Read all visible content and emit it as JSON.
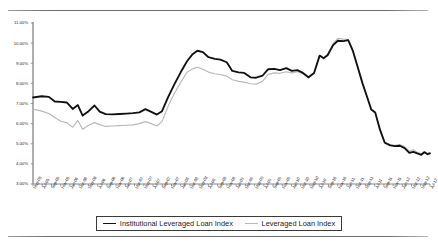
{
  "chart_data": {
    "type": "line",
    "title": "",
    "xlabel": "",
    "ylabel": "",
    "ylim": [
      3.0,
      11.0
    ],
    "ytick_values": [
      11.0,
      10.0,
      9.0,
      8.0,
      7.0,
      6.0,
      5.0,
      4.0,
      3.0
    ],
    "ytick_labels": [
      "11.00%",
      "10.00%",
      "9.00%",
      "8.00%",
      "7.00%",
      "6.00%",
      "5.00%",
      "4.00%",
      "3.00%"
    ],
    "grid": false,
    "legend_position": "bottom",
    "categories": [
      "May-05",
      "Jul-05",
      "Sep-05",
      "Nov-05",
      "Jan-06",
      "Mar-06",
      "May-06",
      "Jul-06",
      "Sep-06",
      "Nov-06",
      "Jan-07",
      "Mar-07",
      "May-07",
      "Jul-07",
      "Sep-07",
      "Nov-07",
      "Jan-08",
      "Mar-08",
      "May-08",
      "Jul-08",
      "Sep-08",
      "Nov-08",
      "Jan-09",
      "Mar-09",
      "May-09",
      "Jul-09",
      "Sep-09",
      "Nov-09",
      "Jan-10",
      "Mar-10",
      "May-10",
      "Jul-10",
      "Sep-10",
      "Nov-10",
      "Jan-11",
      "Mar-11",
      "May-11",
      "Jul-11",
      "Sep-11",
      "Nov-11",
      "Jan-12",
      "Mar-12",
      "May-12",
      "Jul-12"
    ],
    "series": [
      {
        "name": "Institutional Leveraged Loan Index",
        "color": "#111111",
        "values": [
          7.3,
          7.35,
          7.1,
          7.05,
          6.75,
          6.95,
          6.45,
          6.6,
          6.85,
          6.55,
          6.5,
          6.5,
          6.52,
          6.55,
          6.75,
          6.62,
          6.7,
          7.4,
          8.3,
          9.1,
          9.55,
          9.62,
          9.3,
          9.15,
          9.05,
          8.6,
          8.5,
          8.3,
          8.45,
          8.7,
          8.72,
          8.68,
          8.78,
          8.6,
          8.65,
          8.55,
          8.3,
          8.5,
          9.35,
          9.3,
          9.85,
          10.15,
          10.1,
          7.0
        ]
      },
      {
        "name": "Leveraged Loan Index",
        "color": "#b9b9b9",
        "values": [
          6.72,
          6.6,
          6.45,
          6.1,
          5.85,
          6.15,
          5.8,
          5.95,
          6.05,
          5.95,
          5.95,
          5.92,
          5.95,
          6.05,
          6.25,
          6.1,
          6.3,
          7.05,
          7.9,
          8.6,
          8.8,
          8.72,
          8.55,
          8.4,
          8.35,
          8.15,
          8.05,
          8.0,
          8.25,
          8.48,
          8.55,
          8.52,
          8.6,
          8.55,
          8.62,
          8.5,
          8.25,
          8.48,
          9.35,
          9.35,
          9.95,
          10.22,
          10.18,
          7.0
        ]
      }
    ],
    "extended_points": {
      "note": "full-resolution polyline traces used for rendering",
      "institutional": [
        [
          0.0,
          7.3
        ],
        [
          0.022,
          7.36
        ],
        [
          0.04,
          7.33
        ],
        [
          0.055,
          7.1
        ],
        [
          0.07,
          7.08
        ],
        [
          0.085,
          7.05
        ],
        [
          0.1,
          6.73
        ],
        [
          0.113,
          6.92
        ],
        [
          0.125,
          6.4
        ],
        [
          0.14,
          6.62
        ],
        [
          0.155,
          6.9
        ],
        [
          0.168,
          6.6
        ],
        [
          0.183,
          6.47
        ],
        [
          0.2,
          6.46
        ],
        [
          0.218,
          6.48
        ],
        [
          0.235,
          6.5
        ],
        [
          0.252,
          6.52
        ],
        [
          0.268,
          6.56
        ],
        [
          0.283,
          6.72
        ],
        [
          0.298,
          6.58
        ],
        [
          0.312,
          6.45
        ],
        [
          0.325,
          6.62
        ],
        [
          0.34,
          7.3
        ],
        [
          0.356,
          7.95
        ],
        [
          0.372,
          8.55
        ],
        [
          0.388,
          9.1
        ],
        [
          0.402,
          9.45
        ],
        [
          0.414,
          9.62
        ],
        [
          0.428,
          9.55
        ],
        [
          0.442,
          9.3
        ],
        [
          0.458,
          9.22
        ],
        [
          0.472,
          9.18
        ],
        [
          0.488,
          9.05
        ],
        [
          0.502,
          8.62
        ],
        [
          0.518,
          8.55
        ],
        [
          0.532,
          8.52
        ],
        [
          0.548,
          8.3
        ],
        [
          0.562,
          8.28
        ],
        [
          0.578,
          8.38
        ],
        [
          0.592,
          8.7
        ],
        [
          0.608,
          8.72
        ],
        [
          0.622,
          8.66
        ],
        [
          0.638,
          8.76
        ],
        [
          0.652,
          8.62
        ],
        [
          0.666,
          8.66
        ],
        [
          0.68,
          8.52
        ],
        [
          0.694,
          8.3
        ],
        [
          0.708,
          8.52
        ],
        [
          0.722,
          9.38
        ],
        [
          0.732,
          9.25
        ],
        [
          0.742,
          9.4
        ],
        [
          0.756,
          9.9
        ],
        [
          0.768,
          10.12
        ],
        [
          0.782,
          10.1
        ],
        [
          0.794,
          10.15
        ],
        [
          0.806,
          9.6
        ],
        [
          0.818,
          8.8
        ],
        [
          0.83,
          8.0
        ],
        [
          0.842,
          7.3
        ],
        [
          0.852,
          6.7
        ],
        [
          0.862,
          6.55
        ],
        [
          0.874,
          5.7
        ],
        [
          0.886,
          5.05
        ],
        [
          0.9,
          4.92
        ],
        [
          0.912,
          4.88
        ],
        [
          0.924,
          4.9
        ],
        [
          0.936,
          4.78
        ],
        [
          0.948,
          4.55
        ],
        [
          0.958,
          4.6
        ],
        [
          0.968,
          4.52
        ],
        [
          0.978,
          4.45
        ],
        [
          0.986,
          4.58
        ],
        [
          0.994,
          4.48
        ],
        [
          1.0,
          4.52
        ]
      ],
      "leveraged": [
        [
          0.0,
          6.72
        ],
        [
          0.022,
          6.62
        ],
        [
          0.04,
          6.5
        ],
        [
          0.055,
          6.3
        ],
        [
          0.07,
          6.12
        ],
        [
          0.085,
          6.05
        ],
        [
          0.1,
          5.82
        ],
        [
          0.113,
          6.15
        ],
        [
          0.125,
          5.72
        ],
        [
          0.14,
          5.92
        ],
        [
          0.155,
          6.05
        ],
        [
          0.168,
          5.95
        ],
        [
          0.183,
          5.86
        ],
        [
          0.2,
          5.88
        ],
        [
          0.218,
          5.9
        ],
        [
          0.235,
          5.92
        ],
        [
          0.252,
          5.94
        ],
        [
          0.268,
          6.0
        ],
        [
          0.283,
          6.1
        ],
        [
          0.298,
          6.0
        ],
        [
          0.312,
          5.88
        ],
        [
          0.325,
          6.1
        ],
        [
          0.34,
          6.85
        ],
        [
          0.356,
          7.5
        ],
        [
          0.372,
          8.05
        ],
        [
          0.388,
          8.55
        ],
        [
          0.402,
          8.72
        ],
        [
          0.414,
          8.8
        ],
        [
          0.428,
          8.7
        ],
        [
          0.442,
          8.56
        ],
        [
          0.458,
          8.48
        ],
        [
          0.472,
          8.44
        ],
        [
          0.488,
          8.36
        ],
        [
          0.502,
          8.18
        ],
        [
          0.518,
          8.1
        ],
        [
          0.532,
          8.06
        ],
        [
          0.548,
          7.98
        ],
        [
          0.562,
          7.96
        ],
        [
          0.578,
          8.1
        ],
        [
          0.592,
          8.45
        ],
        [
          0.608,
          8.52
        ],
        [
          0.622,
          8.5
        ],
        [
          0.638,
          8.58
        ],
        [
          0.652,
          8.52
        ],
        [
          0.666,
          8.58
        ],
        [
          0.68,
          8.48
        ],
        [
          0.694,
          8.28
        ],
        [
          0.708,
          8.5
        ],
        [
          0.722,
          9.38
        ],
        [
          0.732,
          9.28
        ],
        [
          0.742,
          9.45
        ],
        [
          0.756,
          9.98
        ],
        [
          0.768,
          10.24
        ],
        [
          0.782,
          10.2
        ],
        [
          0.794,
          10.18
        ],
        [
          0.806,
          9.62
        ],
        [
          0.818,
          8.82
        ],
        [
          0.83,
          8.02
        ],
        [
          0.842,
          7.32
        ],
        [
          0.852,
          6.72
        ],
        [
          0.862,
          6.56
        ],
        [
          0.874,
          5.72
        ],
        [
          0.886,
          5.08
        ],
        [
          0.9,
          4.95
        ],
        [
          0.912,
          4.92
        ],
        [
          0.924,
          4.96
        ],
        [
          0.936,
          4.86
        ],
        [
          0.948,
          4.62
        ],
        [
          0.958,
          4.7
        ],
        [
          0.968,
          4.58
        ],
        [
          0.978,
          4.5
        ],
        [
          0.986,
          4.62
        ],
        [
          0.994,
          4.52
        ],
        [
          1.0,
          4.56
        ]
      ]
    }
  },
  "legend": {
    "items": [
      {
        "label": "Institutional Leveraged Loan Index",
        "style": "dark"
      },
      {
        "label": "Leveraged Loan Index",
        "style": "light"
      }
    ]
  }
}
